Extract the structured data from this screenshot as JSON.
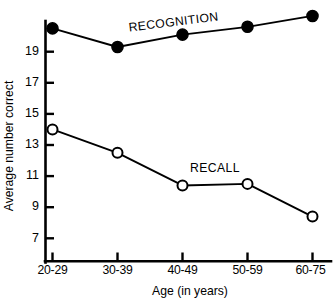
{
  "chart_data": {
    "type": "line",
    "title": "",
    "xlabel": "Age (in years)",
    "ylabel": "Average number correct",
    "categories": [
      "20-29",
      "30-39",
      "40-49",
      "50-59",
      "60-75"
    ],
    "yticks": [
      7,
      9,
      11,
      13,
      15,
      17,
      19
    ],
    "ytick_labels": [
      "7",
      "9",
      "11",
      "13",
      "15",
      "17",
      "19"
    ],
    "ylim": [
      5.5,
      21.8
    ],
    "grid": false,
    "legend": "inline-labels",
    "series": [
      {
        "name": "RECOGNITION",
        "marker": "filled-circle",
        "values": [
          20.5,
          19.3,
          20.1,
          20.6,
          21.3
        ]
      },
      {
        "name": "RECALL",
        "marker": "open-circle",
        "values": [
          14.0,
          12.5,
          10.4,
          10.5,
          8.4
        ]
      }
    ],
    "annotations": [
      {
        "text": "RECOGNITION",
        "series": "RECOGNITION"
      },
      {
        "text": "RECALL",
        "series": "RECALL"
      }
    ]
  },
  "axes": {
    "y_title": "Average number correct",
    "x_title": "Age (in years)",
    "y_tick_0": "7",
    "y_tick_1": "9",
    "y_tick_2": "11",
    "y_tick_3": "13",
    "y_tick_4": "15",
    "y_tick_5": "17",
    "y_tick_6": "19",
    "x_tick_0": "20-29",
    "x_tick_1": "30-39",
    "x_tick_2": "40-49",
    "x_tick_3": "50-59",
    "x_tick_4": "60-75"
  },
  "labels": {
    "recognition": "RECOGNITION",
    "recall": "RECALL"
  },
  "colors": {
    "ink": "#000000",
    "background": "#ffffff"
  }
}
